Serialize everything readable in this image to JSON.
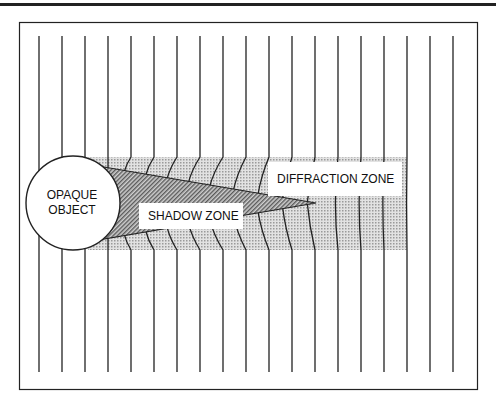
{
  "diagram": {
    "labels": {
      "object_line1": "OPAQUE",
      "object_line2": "OBJECT",
      "shadow_zone": "SHADOW ZONE",
      "diffraction_zone": "DIFFRACTION ZONE"
    },
    "wavefronts": {
      "count": 19,
      "start_x": 39,
      "spacing": 23,
      "top_y": 36,
      "bottom_y": 372
    },
    "colors": {
      "line": "#222222",
      "shade": "#c8c8c8",
      "shadow_dark": "#8a8a8a",
      "background": "#ffffff"
    }
  }
}
